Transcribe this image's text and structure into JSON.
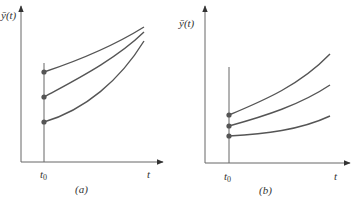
{
  "colors": {
    "background": "#ffffff",
    "axis": "#555555",
    "curve": "#555555",
    "dot": "#555555",
    "text": "#333333"
  },
  "panels": [
    {
      "id": "a",
      "caption": "(a)",
      "y_label": "ȳ(t)",
      "x_label": "t",
      "t0_label": "t",
      "t0_sub": "0",
      "initial_points": 3,
      "description": "Trajectories starting at t0 from three initial values converge toward each other as t increases"
    },
    {
      "id": "b",
      "caption": "(b)",
      "y_label": "ȳ(t)",
      "x_label": "t",
      "t0_label": "t",
      "t0_sub": "0",
      "initial_points": 3,
      "description": "Trajectories starting at t0 from three close initial values diverge as t increases"
    }
  ]
}
